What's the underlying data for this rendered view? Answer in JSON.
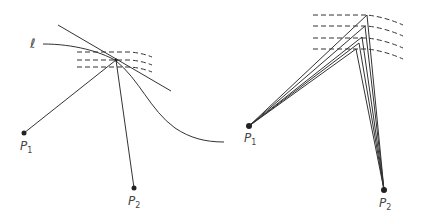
{
  "left_figure": {
    "curve_label": "ℓ",
    "points": [
      {
        "name": "P",
        "sub": "1"
      },
      {
        "name": "P",
        "sub": "2"
      }
    ]
  },
  "right_figure": {
    "points": [
      {
        "name": "P",
        "sub": "1"
      },
      {
        "name": "P",
        "sub": "2"
      }
    ]
  },
  "colors": {
    "stroke": "#333333",
    "label": "#444444"
  }
}
